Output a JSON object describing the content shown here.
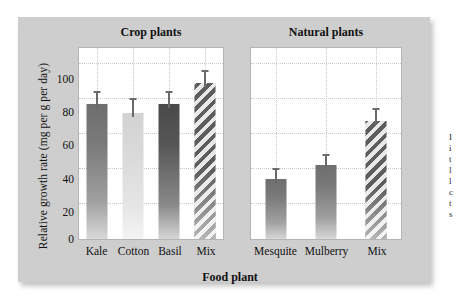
{
  "chart_data": {
    "type": "bar",
    "title": "",
    "xlabel": "Food plant",
    "ylabel": "Relative growth rate (mg per g per day)",
    "ylim": [
      0,
      110
    ],
    "yticks": [
      0,
      20,
      40,
      60,
      80,
      100
    ],
    "grid": true,
    "legend": "none",
    "panels": [
      {
        "name": "Crop plants",
        "categories": [
          "Kale",
          "Cotton",
          "Basil",
          "Mix"
        ],
        "values": [
          77,
          72,
          77,
          89
        ],
        "errors": [
          4,
          5,
          4,
          4
        ],
        "fills": [
          "solid-dark",
          "solid-light",
          "solid-darker",
          "hatched"
        ]
      },
      {
        "name": "Natural plants",
        "categories": [
          "Mesquite",
          "Mulberry",
          "Mix"
        ],
        "values": [
          34,
          42,
          67
        ],
        "errors": [
          3,
          3,
          4
        ],
        "fills": [
          "solid-dark",
          "solid-dark",
          "hatched"
        ]
      }
    ]
  },
  "axis": {
    "ylabel": "Relative growth rate (mg per g per day)",
    "xlabel": "Food plant",
    "tick_100": "100",
    "tick_80": "80",
    "tick_60": "60",
    "tick_40": "40",
    "tick_20": "20",
    "tick_0": "0"
  },
  "panels": {
    "crop_title": "Natural plants",
    "left_title": "Crop plants",
    "right_title": "Natural plants"
  },
  "categories": {
    "kale": "Kale",
    "cotton": "Cotton",
    "basil": "Basil",
    "mix_crop": "Mix",
    "mesquite": "Mesquite",
    "mulberry": "Mulberry",
    "mix_natural": "Mix"
  },
  "colors": {
    "card": "#cecece",
    "panel": "#ffffff",
    "bar_dark": "#6e6e6e",
    "bar_darker": "#4a4a4a",
    "bar_light": "#d8d8d8",
    "hatch": "#5d5d5d",
    "grid": "#c9c9c9",
    "text": "#111111"
  }
}
